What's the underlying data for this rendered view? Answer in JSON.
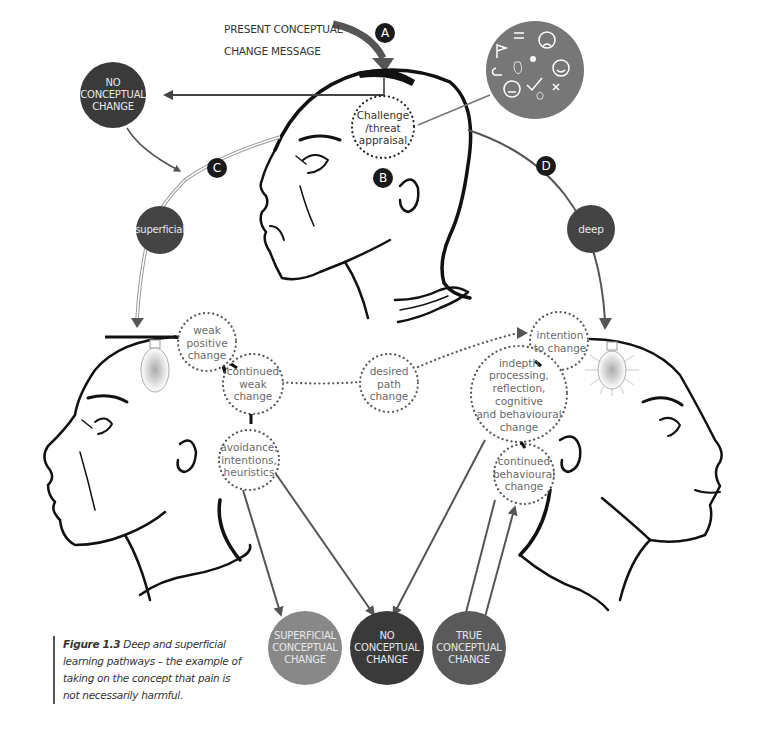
{
  "header": {
    "message_line1": "PRESENT CONCEPTUAL",
    "message_line2": "CHANGE MESSAGE"
  },
  "badges": {
    "a": "A",
    "b": "B",
    "c": "C",
    "d": "D"
  },
  "appraisal": {
    "line1": "Challenge",
    "line2": "/threat",
    "line3": "appraisal"
  },
  "emotion_cluster": {
    "icons": [
      "swap-arrows-icon",
      "sad-face-icon",
      "flag-icon",
      "bomb-icon",
      "happy-face-icon",
      "hand-icon",
      "return-arrow-icon",
      "check-icon",
      "neutral-face-icon",
      "cross-icon",
      "lightbulb-icon"
    ]
  },
  "no_change_top": {
    "line1": "NO",
    "line2": "CONCEPTUAL",
    "line3": "CHANGE"
  },
  "paths": {
    "superficial": "superficial",
    "deep": "deep"
  },
  "superficial_path": {
    "weak_positive": {
      "line1": "weak",
      "line2": "positive",
      "line3": "change"
    },
    "continued_weak": {
      "line1": "continued",
      "line2": "weak",
      "line3": "change"
    },
    "avoidance": {
      "line1": "avoidance,",
      "line2": "intentions,",
      "line3": "heuristics"
    }
  },
  "desired": {
    "line1": "desired",
    "line2": "path",
    "line3": "change"
  },
  "deep_path": {
    "intention": {
      "line1": "intention",
      "line2": "to change"
    },
    "indepth": {
      "line1": "indepth",
      "line2": "processing,",
      "line3": "reflection, cognitive",
      "line4": "and behavioural",
      "line5": "change"
    },
    "continued_behavioural": {
      "line1": "continued",
      "line2": "behavioural",
      "line3": "change"
    }
  },
  "outcomes": {
    "superficial": {
      "line1": "SUPERFICIAL",
      "line2": "CONCEPTUAL",
      "line3": "CHANGE"
    },
    "none": {
      "line1": "NO",
      "line2": "CONCEPTUAL",
      "line3": "CHANGE"
    },
    "true": {
      "line1": "TRUE",
      "line2": "CONCEPTUAL",
      "line3": "CHANGE"
    }
  },
  "caption": {
    "figure": "Figure 1.3",
    "text": " Deep and superficial learning pathways – the example of taking on the concept that pain is not necessarily harmful."
  },
  "colors": {
    "dark_circle": "#3a3a3a",
    "mid_circle": "#5a5a5a",
    "light_circle": "#8a8a8a",
    "arrow": "#555555",
    "badge": "#1a1a1a"
  }
}
